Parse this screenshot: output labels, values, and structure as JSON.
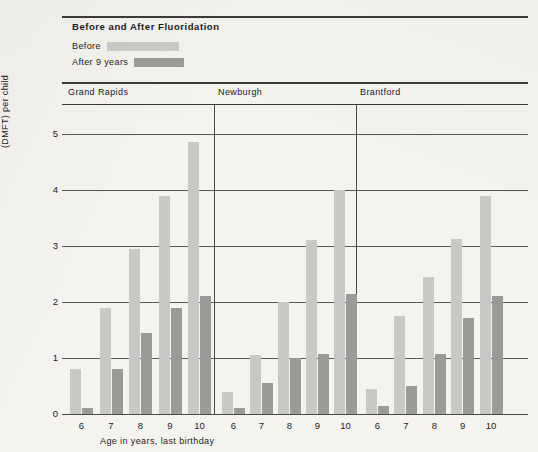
{
  "chart_title": "Before and After Fluoridation",
  "legend": [
    {
      "label": "Before",
      "key": "before",
      "color": "#c8c8c6"
    },
    {
      "label": "After 9 years",
      "key": "after",
      "color": "#9a9a98"
    }
  ],
  "axes": {
    "y_title": "Number of decayed, missing, and filled permanent teeth (DMFT) per child",
    "x_title": "Age in years, last birthday",
    "y_ticks": [
      "0",
      "1",
      "2",
      "3",
      "4",
      "5"
    ],
    "ylim": [
      0,
      5.6
    ]
  },
  "panels": [
    {
      "label": "Grand Rapids"
    },
    {
      "label": "Newburgh"
    },
    {
      "label": "Brantford"
    }
  ],
  "chart_data": {
    "type": "bar",
    "title": "Before and After Fluoridation",
    "xlabel": "Age in years, last birthday",
    "ylabel": "Number of decayed, missing, and filled permanent teeth (DMFT) per child",
    "ylim": [
      0,
      5.6
    ],
    "yticks": [
      0,
      1,
      2,
      3,
      4,
      5
    ],
    "grid": "horizontal",
    "legend_position": "top-left",
    "grouping": "panels by city, bars by age, two series (Before / After 9 years)",
    "categories": [
      "6",
      "7",
      "8",
      "9",
      "10"
    ],
    "panels": [
      {
        "name": "Grand Rapids",
        "categories": [
          "6",
          "7",
          "8",
          "9",
          "10"
        ],
        "series": [
          {
            "name": "Before",
            "values": [
              0.8,
              1.9,
              2.95,
              3.9,
              4.85
            ]
          },
          {
            "name": "After 9 years",
            "values": [
              0.1,
              0.8,
              1.45,
              1.9,
              2.1
            ]
          }
        ]
      },
      {
        "name": "Newburgh",
        "categories": [
          "6",
          "7",
          "8",
          "9",
          "10"
        ],
        "series": [
          {
            "name": "Before",
            "values": [
              0.4,
              1.05,
              2.0,
              3.1,
              4.0
            ]
          },
          {
            "name": "After 9 years",
            "values": [
              0.1,
              0.55,
              1.0,
              1.07,
              2.15
            ]
          }
        ]
      },
      {
        "name": "Brantford",
        "categories": [
          "6",
          "7",
          "8",
          "9",
          "10"
        ],
        "series": [
          {
            "name": "Before",
            "values": [
              0.45,
              1.75,
              2.45,
              3.12,
              3.9
            ]
          },
          {
            "name": "After 9 years",
            "values": [
              0.15,
              0.5,
              1.08,
              1.72,
              2.1
            ]
          }
        ]
      }
    ]
  }
}
